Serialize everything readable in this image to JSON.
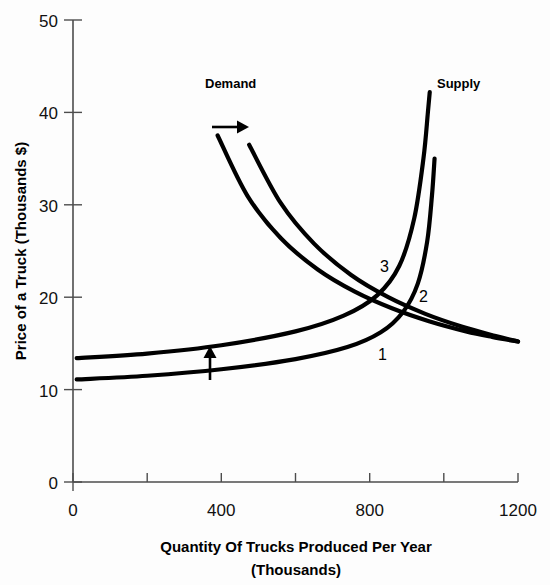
{
  "chart_data": {
    "type": "line",
    "title": "",
    "xlabel": "Quantity Of Trucks Produced Per Year",
    "xlabel_line2": "(Thousands)",
    "ylabel": "Price of a Truck (Thousands $)",
    "xlim": [
      0,
      1200
    ],
    "ylim": [
      0,
      50
    ],
    "xticks": [
      0,
      200,
      400,
      600,
      800,
      1000,
      1200
    ],
    "xtick_labels": [
      "0",
      "",
      "400",
      "",
      "800",
      "",
      "1200"
    ],
    "yticks": [
      0,
      10,
      20,
      30,
      40,
      50
    ],
    "ytick_labels": [
      "0",
      "10",
      "20",
      "30",
      "40",
      "50"
    ],
    "grid": false,
    "legend_position": "inline-annotations",
    "series": [
      {
        "name": "Demand 1",
        "kind": "demand",
        "points": [
          [
            390,
            37.5
          ],
          [
            470,
            31.0
          ],
          [
            560,
            26.4
          ],
          [
            660,
            23.0
          ],
          [
            760,
            20.6
          ],
          [
            860,
            18.8
          ],
          [
            960,
            17.4
          ],
          [
            1060,
            16.3
          ],
          [
            1130,
            15.7
          ],
          [
            1200,
            15.2
          ]
        ]
      },
      {
        "name": "Demand 2",
        "kind": "demand",
        "points": [
          [
            475,
            36.5
          ],
          [
            560,
            30.2
          ],
          [
            650,
            25.8
          ],
          [
            750,
            22.4
          ],
          [
            850,
            20.0
          ],
          [
            950,
            18.2
          ],
          [
            1050,
            16.8
          ],
          [
            1140,
            15.8
          ],
          [
            1200,
            15.2
          ]
        ]
      },
      {
        "name": "Supply 1",
        "kind": "supply",
        "points": [
          [
            10,
            11.1
          ],
          [
            200,
            11.5
          ],
          [
            400,
            12.2
          ],
          [
            600,
            13.3
          ],
          [
            740,
            14.6
          ],
          [
            830,
            16.2
          ],
          [
            890,
            18.4
          ],
          [
            930,
            21.5
          ],
          [
            955,
            26.0
          ],
          [
            968,
            31.0
          ],
          [
            975,
            35.0
          ]
        ]
      },
      {
        "name": "Supply 2",
        "kind": "supply",
        "points": [
          [
            10,
            13.4
          ],
          [
            200,
            13.9
          ],
          [
            400,
            14.8
          ],
          [
            600,
            16.3
          ],
          [
            730,
            18.0
          ],
          [
            820,
            20.2
          ],
          [
            880,
            23.4
          ],
          [
            920,
            28.5
          ],
          [
            945,
            35.0
          ],
          [
            957,
            40.0
          ],
          [
            962,
            42.2
          ]
        ]
      }
    ],
    "annotations": [
      {
        "name": "demand-label",
        "text": "Demand",
        "x_px": 205,
        "y_px": 88
      },
      {
        "name": "supply-label",
        "text": "Supply",
        "x_px": 437,
        "y_px": 88
      },
      {
        "name": "equilibrium-1",
        "text": "1",
        "x_px": 378,
        "y_px": 360
      },
      {
        "name": "equilibrium-2",
        "text": "2",
        "x_px": 419,
        "y_px": 302
      },
      {
        "name": "equilibrium-3",
        "text": "3",
        "x_px": 380,
        "y_px": 272
      },
      {
        "name": "demand-shift-arrow",
        "text": "",
        "direction": "right"
      },
      {
        "name": "supply-shift-arrow",
        "text": "",
        "direction": "up"
      }
    ],
    "colors": {
      "curve": "#000000",
      "axis": "#4d4d4d",
      "background": "#fdfdfd",
      "text": "#000000"
    }
  }
}
